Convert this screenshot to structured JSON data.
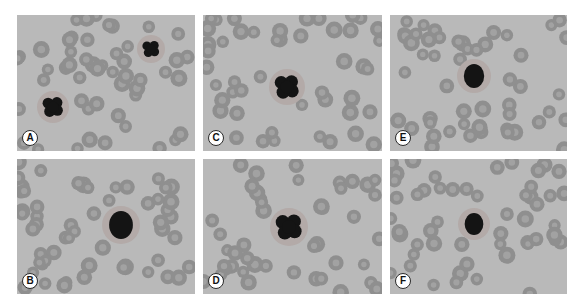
{
  "figure": {
    "panels": [
      {
        "id": "A",
        "label": "A",
        "x": 17,
        "y": 15,
        "w": 178,
        "h": 136,
        "cells": [
          {
            "type": "nucleus",
            "cx": 36,
            "cy": 92,
            "r": 11,
            "lobed": true
          },
          {
            "type": "nucleus",
            "cx": 134,
            "cy": 34,
            "r": 9,
            "lobed": true
          }
        ]
      },
      {
        "id": "B",
        "label": "B",
        "x": 17,
        "y": 159,
        "w": 178,
        "h": 135,
        "cells": [
          {
            "type": "nucleus",
            "cx": 104,
            "cy": 66,
            "r": 14,
            "lobed": false
          }
        ]
      },
      {
        "id": "C",
        "label": "C",
        "x": 203,
        "y": 15,
        "w": 179,
        "h": 136,
        "cells": [
          {
            "type": "nucleus",
            "cx": 84,
            "cy": 72,
            "r": 13,
            "lobed": true
          }
        ]
      },
      {
        "id": "D",
        "label": "D",
        "x": 203,
        "y": 159,
        "w": 179,
        "h": 135,
        "cells": [
          {
            "type": "nucleus",
            "cx": 86,
            "cy": 68,
            "r": 14,
            "lobed": true
          }
        ]
      },
      {
        "id": "E",
        "label": "E",
        "x": 390,
        "y": 15,
        "w": 177,
        "h": 136,
        "cells": [
          {
            "type": "nucleus",
            "cx": 84,
            "cy": 61,
            "r": 12,
            "lobed": false
          }
        ]
      },
      {
        "id": "F",
        "label": "F",
        "x": 390,
        "y": 159,
        "w": 177,
        "h": 135,
        "cells": [
          {
            "type": "nucleus",
            "cx": 84,
            "cy": 65,
            "r": 11,
            "lobed": false
          }
        ]
      }
    ]
  },
  "colors": {
    "background": "#b9b9b9",
    "rbc_fill": "#8f8f8f",
    "rbc_center": "#a9a9a9",
    "nucleus": "#141414",
    "label_bg": "#ffffff"
  }
}
